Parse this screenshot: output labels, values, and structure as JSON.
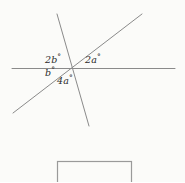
{
  "figure": {
    "background_color": "#fbfbf9",
    "stroke_color": "#8a8a8a",
    "text_color": "#2b2b2b",
    "width": 185,
    "height": 182
  },
  "diagram": {
    "type": "intersecting-lines-angle-figure",
    "intersection_point": {
      "x": 70,
      "y": 68
    },
    "lines": [
      {
        "name": "horizontal-line",
        "x1": 12,
        "y1": 68.5,
        "x2": 175,
        "y2": 68.5
      },
      {
        "name": "steep-line",
        "x1": 57,
        "y1": 14,
        "x2": 89,
        "y2": 126
      },
      {
        "name": "diagonal-line",
        "x1": 13,
        "y1": 113,
        "x2": 142,
        "y2": 14
      }
    ],
    "labels": [
      {
        "id": "label-2b",
        "coefficient": "2",
        "variable": "b",
        "degree": "°",
        "text": "2b°",
        "position": "upper-left"
      },
      {
        "id": "label-2a",
        "coefficient": "2",
        "variable": "a",
        "degree": "°",
        "text": "2a°",
        "position": "upper-right"
      },
      {
        "id": "label-b",
        "coefficient": "",
        "variable": "b",
        "degree": "°",
        "text": "b°",
        "position": "left-below"
      },
      {
        "id": "label-4a",
        "coefficient": "4",
        "variable": "a",
        "degree": "°",
        "text": "4a°",
        "position": "bottom-center"
      }
    ]
  },
  "answer_box": {
    "name": "answer-box",
    "x": 57,
    "y": 161,
    "width": 74,
    "height": 30,
    "value": "",
    "placeholder": ""
  }
}
